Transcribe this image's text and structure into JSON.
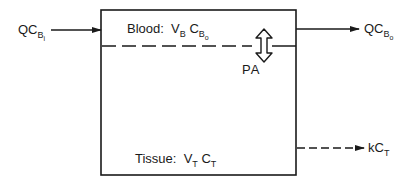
{
  "diagram": {
    "type": "compartment-model",
    "compartment": {
      "blood_region": {
        "label": "Blood:",
        "volume": {
          "symbol": "V",
          "subscript": "B"
        },
        "concentration": {
          "symbol": "C",
          "subscript": "B",
          "sub_subscript": "o"
        }
      },
      "tissue_region": {
        "label": "Tissue:",
        "volume": {
          "symbol": "V",
          "subscript": "T"
        },
        "concentration": {
          "symbol": "C",
          "subscript": "T"
        }
      },
      "exchange": {
        "label": "PA"
      }
    },
    "flows": {
      "inflow": {
        "prefix": "QC",
        "subscript": "B",
        "sub_subscript": "i"
      },
      "outflow": {
        "prefix": "QC",
        "subscript": "B",
        "sub_subscript": "o"
      },
      "elimination": {
        "prefix": "kC",
        "subscript": "T"
      }
    },
    "colors": {
      "line": "#1a1a1a",
      "background": "#ffffff"
    }
  }
}
